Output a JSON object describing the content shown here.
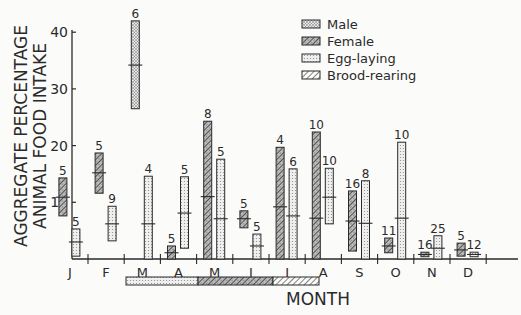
{
  "chart_data": {
    "type": "bar",
    "subtype": "range-bar-with-mean",
    "title": "",
    "xlabel": "MONTH",
    "ylabel_lines": [
      "AGGREGATE  PERCENTAGE",
      "ANIMAL  FOOD  INTAKE"
    ],
    "ylim": [
      0,
      42
    ],
    "yticks": [
      10,
      20,
      30,
      40
    ],
    "grid": false,
    "legend_position": "upper-right",
    "categories": [
      "J",
      "F",
      "M",
      "A",
      "M",
      "J",
      "J",
      "A",
      "S",
      "O",
      "N",
      "D"
    ],
    "legend": [
      {
        "key": "male",
        "label": "Male",
        "pattern": "dots-dense"
      },
      {
        "key": "female",
        "label": "Female",
        "pattern": "hatch-dense"
      },
      {
        "key": "egg",
        "label": "Egg-laying",
        "pattern": "dots-light"
      },
      {
        "key": "brood",
        "label": "Brood-rearing",
        "pattern": "diagonal"
      }
    ],
    "series": [
      {
        "name": "Male",
        "points": [
          {
            "month": "M",
            "index": 2,
            "low": 26.5,
            "high": 42.0,
            "mean": 34.2,
            "n": 6
          }
        ]
      },
      {
        "name": "Female",
        "points": [
          {
            "month": "J",
            "index": 0,
            "low": 7.6,
            "high": 14.3,
            "mean": 10.9,
            "n": 5
          },
          {
            "month": "F",
            "index": 1,
            "low": 11.6,
            "high": 18.7,
            "mean": 15.2,
            "n": 5
          },
          {
            "month": "A",
            "index": 3,
            "low": 0.0,
            "high": 2.3,
            "mean": 1.1,
            "n": 5
          },
          {
            "month": "M",
            "index": 4,
            "low": 0.0,
            "high": 24.3,
            "mean": 11.0,
            "n": 8
          },
          {
            "month": "J",
            "index": 5,
            "low": 5.5,
            "high": 8.5,
            "mean": 7.1,
            "n": 5
          },
          {
            "month": "J",
            "index": 6,
            "low": 0.0,
            "high": 19.7,
            "mean": 9.2,
            "n": 4
          },
          {
            "month": "A",
            "index": 7,
            "low": 0.0,
            "high": 22.4,
            "mean": 7.2,
            "n": 10
          },
          {
            "month": "S",
            "index": 8,
            "low": 1.4,
            "high": 12.0,
            "mean": 6.7,
            "n": 16
          },
          {
            "month": "O",
            "index": 9,
            "low": 1.1,
            "high": 3.7,
            "mean": 2.3,
            "n": 11
          },
          {
            "month": "N",
            "index": 10,
            "low": 0.4,
            "high": 1.2,
            "mean": 0.8,
            "n": 16
          },
          {
            "month": "D",
            "index": 11,
            "low": 0.5,
            "high": 2.8,
            "mean": 1.6,
            "n": 5
          }
        ]
      },
      {
        "name": "Egg-laying",
        "points": [
          {
            "month": "J",
            "index": 0,
            "low": 0.5,
            "high": 5.3,
            "mean": 3.0,
            "n": 5
          },
          {
            "month": "F",
            "index": 1,
            "low": 3.2,
            "high": 9.3,
            "mean": 6.2,
            "n": 9
          },
          {
            "month": "M",
            "index": 2,
            "low": 0.0,
            "high": 14.6,
            "mean": 6.2,
            "n": 4
          },
          {
            "month": "A",
            "index": 3,
            "low": 1.9,
            "high": 14.5,
            "mean": 8.1,
            "n": 5
          },
          {
            "month": "M",
            "index": 4,
            "low": 0.0,
            "high": 17.6,
            "mean": 7.1,
            "n": 5
          },
          {
            "month": "J",
            "index": 5,
            "low": 0.0,
            "high": 4.4,
            "mean": 2.3,
            "n": 5
          },
          {
            "month": "J",
            "index": 6,
            "low": 0.0,
            "high": 15.9,
            "mean": 7.6,
            "n": 6
          },
          {
            "month": "A",
            "index": 7,
            "low": 6.2,
            "high": 16.0,
            "mean": 10.9,
            "n": 10
          },
          {
            "month": "S",
            "index": 8,
            "low": 0.0,
            "high": 13.8,
            "mean": 6.3,
            "n": 8
          },
          {
            "month": "O",
            "index": 9,
            "low": 0.0,
            "high": 20.6,
            "mean": 7.2,
            "n": 10
          },
          {
            "month": "N",
            "index": 10,
            "low": 0.0,
            "high": 4.1,
            "mean": 1.9,
            "n": 25
          },
          {
            "month": "D",
            "index": 11,
            "low": 0.4,
            "high": 1.2,
            "mean": 0.8,
            "n": 12
          }
        ]
      }
    ],
    "season_bar": [
      {
        "label": "Egg-laying",
        "from_month": "F",
        "to_month": "A",
        "pattern": "dots-light"
      },
      {
        "label": "Brood-rearing",
        "from_month": "A",
        "to_month": "J",
        "pattern": "diagonal"
      }
    ]
  },
  "colors": {
    "ink": "#2a2a2a",
    "background": "#fbfbfa",
    "dot_fill": "#cfcfcf"
  }
}
